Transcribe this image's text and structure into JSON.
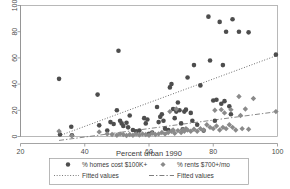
{
  "chart_data": {
    "type": "scatter",
    "title": "",
    "xlabel": "Percent urban 1990",
    "ylabel": "",
    "xlim": [
      20,
      100
    ],
    "ylim": [
      0,
      100
    ],
    "xticks": [
      20,
      40,
      60,
      80,
      100
    ],
    "yticks": [
      0,
      20,
      40,
      60,
      80,
      100
    ],
    "grid": false,
    "legend_position": "bottom",
    "series": [
      {
        "name": "% homes cost $100K+",
        "marker": "circle",
        "color": "#4d4d4d",
        "points": [
          [
            32.0,
            44.0
          ],
          [
            32.3,
            1.5
          ],
          [
            35.8,
            7.5
          ],
          [
            36.0,
            1.0
          ],
          [
            44.0,
            32.0
          ],
          [
            44.5,
            8.5
          ],
          [
            47.0,
            4.5
          ],
          [
            48.0,
            11.0
          ],
          [
            49.0,
            9.5
          ],
          [
            50.0,
            20.0
          ],
          [
            50.5,
            65.5
          ],
          [
            51.0,
            12.0
          ],
          [
            51.5,
            10.0
          ],
          [
            52.0,
            8.0
          ],
          [
            53.0,
            10.5
          ],
          [
            53.5,
            7.0
          ],
          [
            54.0,
            16.0
          ],
          [
            55.0,
            5.0
          ],
          [
            56.0,
            4.0
          ],
          [
            57.0,
            4.5
          ],
          [
            58.5,
            14.0
          ],
          [
            59.0,
            10.0
          ],
          [
            59.5,
            13.0
          ],
          [
            60.0,
            2.0
          ],
          [
            61.0,
            3.0
          ],
          [
            62.5,
            22.5
          ],
          [
            63.0,
            11.0
          ],
          [
            63.5,
            15.0
          ],
          [
            64.0,
            17.0
          ],
          [
            64.5,
            12.0
          ],
          [
            65.0,
            6.0
          ],
          [
            66.0,
            5.0
          ],
          [
            66.5,
            37.5
          ],
          [
            67.0,
            40.0
          ],
          [
            67.5,
            21.0
          ],
          [
            68.0,
            14.0
          ],
          [
            68.5,
            19.0
          ],
          [
            69.0,
            26.0
          ],
          [
            69.5,
            20.0
          ],
          [
            70.0,
            10.0
          ],
          [
            70.5,
            5.5
          ],
          [
            71.0,
            19.0
          ],
          [
            71.5,
            20.5
          ],
          [
            72.0,
            45.0
          ],
          [
            73.0,
            18.0
          ],
          [
            73.5,
            12.0
          ],
          [
            74.0,
            54.5
          ],
          [
            75.0,
            9.0
          ],
          [
            76.0,
            39.0
          ],
          [
            77.0,
            4.5
          ],
          [
            78.5,
            91.5
          ],
          [
            79.0,
            58.0
          ],
          [
            80.0,
            27.5
          ],
          [
            80.5,
            12.0
          ],
          [
            81.0,
            28.0
          ],
          [
            82.0,
            87.5
          ],
          [
            82.5,
            25.0
          ],
          [
            83.0,
            54.5
          ],
          [
            83.5,
            27.0
          ],
          [
            84.0,
            80.0
          ],
          [
            85.0,
            23.0
          ],
          [
            85.5,
            17.0
          ],
          [
            86.0,
            89.5
          ],
          [
            88.0,
            80.0
          ],
          [
            91.0,
            79.5
          ],
          [
            99.5,
            62.5
          ]
        ]
      },
      {
        "name": "% rents $700+/mo",
        "marker": "diamond",
        "color": "#8a8a8a",
        "points": [
          [
            32.0,
            4.0
          ],
          [
            36.0,
            0.5
          ],
          [
            44.5,
            3.5
          ],
          [
            47.0,
            2.0
          ],
          [
            48.5,
            1.5
          ],
          [
            50.0,
            1.0
          ],
          [
            51.0,
            2.0
          ],
          [
            52.0,
            1.5
          ],
          [
            53.0,
            0.8
          ],
          [
            54.0,
            1.5
          ],
          [
            55.0,
            1.0
          ],
          [
            56.0,
            2.0
          ],
          [
            57.0,
            1.2
          ],
          [
            58.0,
            2.0
          ],
          [
            59.0,
            1.5
          ],
          [
            60.0,
            1.0
          ],
          [
            61.0,
            2.5
          ],
          [
            62.0,
            1.5
          ],
          [
            63.0,
            2.0
          ],
          [
            64.0,
            3.0
          ],
          [
            65.0,
            2.0
          ],
          [
            66.0,
            3.0
          ],
          [
            66.5,
            19.0
          ],
          [
            67.0,
            4.0
          ],
          [
            67.5,
            5.0
          ],
          [
            68.0,
            2.5
          ],
          [
            68.5,
            21.0
          ],
          [
            69.0,
            4.5
          ],
          [
            70.0,
            3.0
          ],
          [
            70.5,
            5.0
          ],
          [
            71.0,
            4.0
          ],
          [
            71.5,
            6.0
          ],
          [
            72.0,
            5.0
          ],
          [
            73.0,
            4.0
          ],
          [
            74.0,
            5.5
          ],
          [
            75.0,
            4.0
          ],
          [
            76.0,
            6.0
          ],
          [
            77.0,
            5.0
          ],
          [
            78.0,
            9.0
          ],
          [
            79.0,
            7.0
          ],
          [
            80.0,
            6.0
          ],
          [
            80.5,
            20.0
          ],
          [
            81.0,
            8.0
          ],
          [
            82.0,
            5.0
          ],
          [
            82.5,
            20.5
          ],
          [
            83.0,
            7.0
          ],
          [
            83.5,
            18.0
          ],
          [
            84.0,
            6.0
          ],
          [
            85.0,
            9.0
          ],
          [
            85.5,
            20.5
          ],
          [
            86.0,
            7.0
          ],
          [
            87.0,
            5.0
          ],
          [
            88.0,
            30.5
          ],
          [
            88.5,
            16.0
          ],
          [
            89.0,
            6.0
          ],
          [
            90.0,
            21.0
          ],
          [
            91.0,
            5.5
          ],
          [
            92.5,
            29.0
          ],
          [
            99.5,
            19.0
          ]
        ]
      }
    ],
    "fits": [
      {
        "name": "Fitted values",
        "for_series": "% homes cost $100K+",
        "style": "dotted",
        "color": "#4d4d4d",
        "x": [
          32.0,
          100.0
        ],
        "y": [
          0.5,
          62.0
        ]
      },
      {
        "name": "Fitted values",
        "for_series": "% rents $700+/mo",
        "style": "dashdot",
        "color": "#7a7a7a",
        "x": [
          32.0,
          100.0
        ],
        "y": [
          -3.0,
          19.0
        ]
      }
    ]
  },
  "axes": {
    "x_tick_labels": [
      "20",
      "40",
      "60",
      "80",
      "100"
    ],
    "y_tick_labels": [
      "0",
      "20",
      "40",
      "60",
      "80",
      "100"
    ],
    "x_axis_title": "Percent urban 1990"
  },
  "legend": {
    "entries": [
      {
        "label": "% homes cost $100K+",
        "marker": "circle-marker"
      },
      {
        "label": "% rents $700+/mo",
        "marker": "diamond-marker"
      },
      {
        "label": "Fitted values",
        "marker": "dotted-line"
      },
      {
        "label": "Fitted values",
        "marker": "dashdot-line"
      }
    ]
  },
  "colors": {
    "circle_marker": "#4d4d4d",
    "diamond_marker": "#8a8a8a",
    "axis": "#8d8d8d",
    "frame": "#9a9a9a",
    "text": "#3a3a3a"
  }
}
